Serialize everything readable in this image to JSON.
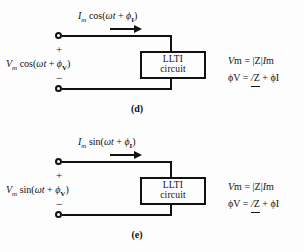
{
  "figure": {
    "background_color": "#fdfdfd",
    "ink_color": "#111111"
  },
  "panels": [
    {
      "id": "d",
      "caption": "(d)",
      "box_label_line1": "LLTI",
      "box_label_line2": "circuit",
      "current_label": {
        "amplitude": "I",
        "amplitude_sub": "m",
        "function": "cos",
        "argument_open": "(",
        "omega": "ω",
        "t": "t",
        "plus": "+",
        "phi": "ϕ",
        "phi_sub": "I",
        "argument_close": ")"
      },
      "voltage_label": {
        "amplitude": "V",
        "amplitude_sub": "m",
        "function": "cos",
        "argument_open": "(",
        "omega": "ω",
        "t": "t",
        "plus": "+",
        "phi": "ϕ",
        "phi_sub": "V",
        "argument_close": ")"
      },
      "polarity_plus": "+",
      "polarity_minus": "−",
      "equations": {
        "magnitude": {
          "lhs": "V",
          "lhs_sub": "m",
          "eq": "=",
          "bar_open": "|",
          "z": "Z",
          "bar_close": "|",
          "rhs": "I",
          "rhs_sub": "m"
        },
        "phase": {
          "lhs": "ϕ",
          "lhs_sub": "V",
          "eq": "=",
          "angle_slash": "/",
          "z": "Z",
          "plus": "+",
          "rhs": "ϕ",
          "rhs_sub": "I"
        }
      }
    },
    {
      "id": "e",
      "caption": "(e)",
      "box_label_line1": "LLTI",
      "box_label_line2": "circuit",
      "current_label": {
        "amplitude": "I",
        "amplitude_sub": "m",
        "function": "sin",
        "argument_open": "(",
        "omega": "ω",
        "t": "t",
        "plus": "+",
        "phi": "ϕ",
        "phi_sub": "I",
        "argument_close": ")"
      },
      "voltage_label": {
        "amplitude": "V",
        "amplitude_sub": "m",
        "function": "sin",
        "argument_open": "(",
        "omega": "ω",
        "t": "t",
        "plus": "+",
        "phi": "ϕ",
        "phi_sub": "V",
        "argument_close": ")"
      },
      "polarity_plus": "+",
      "polarity_minus": "−",
      "equations": {
        "magnitude": {
          "lhs": "V",
          "lhs_sub": "m",
          "eq": "=",
          "bar_open": "|",
          "z": "Z",
          "bar_close": "|",
          "rhs": "I",
          "rhs_sub": "m"
        },
        "phase": {
          "lhs": "ϕ",
          "lhs_sub": "V",
          "eq": "=",
          "angle_slash": "/",
          "z": "Z",
          "plus": "+",
          "rhs": "ϕ",
          "rhs_sub": "I"
        }
      }
    }
  ]
}
